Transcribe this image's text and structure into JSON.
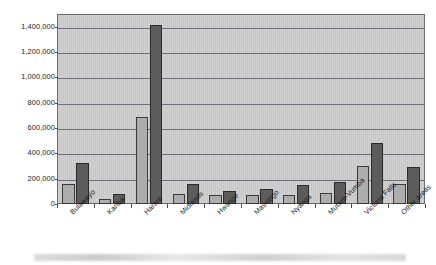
{
  "chart_data": {
    "type": "bar",
    "title": "",
    "xlabel": "",
    "ylabel": "",
    "ylim": [
      0,
      1500000
    ],
    "grid": true,
    "legend_position": "none",
    "orientation": "vertical",
    "grouping": "grouped",
    "categories": [
      "Bulawayo",
      "Kariba",
      "Harare",
      "Midlands",
      "Hwange",
      "Masvingo",
      "Nyanga",
      "Mutare-Vumba",
      "Victoria Falls",
      "Other areas"
    ],
    "series": [
      {
        "name": "series-1",
        "color": "#adadad",
        "values": [
          160000,
          40000,
          685000,
          80000,
          70000,
          70000,
          75000,
          85000,
          300000,
          155000
        ]
      },
      {
        "name": "series-2",
        "color": "#5c5c5c",
        "values": [
          325000,
          80000,
          1410000,
          160000,
          105000,
          115000,
          150000,
          175000,
          480000,
          290000
        ]
      }
    ],
    "ytick_values": [
      0,
      200000,
      400000,
      600000,
      800000,
      1000000,
      1200000,
      1400000
    ],
    "ytick_labels": [
      "0",
      "200,000",
      "400,000",
      "600,000",
      "800,000",
      "1,000,000",
      "1,200,000",
      "1,400,000"
    ]
  },
  "colors": {
    "plot_background": "#c9c9c9",
    "plot_border": "#6a6a76",
    "gridline": "#6f6f7a",
    "series_1": "#adadad",
    "series_2": "#5c5c5c",
    "text": "#1a1a1a"
  }
}
